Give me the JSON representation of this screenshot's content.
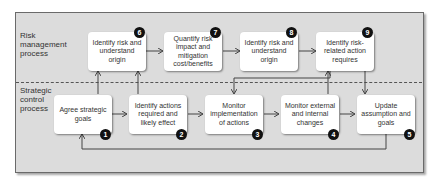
{
  "lanes": {
    "risk": "Risk management process",
    "strategic": "Strategic control process"
  },
  "boxes": [
    {
      "id": 1,
      "label": "Agree strategic goals",
      "lane": "strategic"
    },
    {
      "id": 2,
      "label": "Identify actions required and likely effect",
      "lane": "strategic"
    },
    {
      "id": 3,
      "label": "Monitor implementation of actions",
      "lane": "strategic"
    },
    {
      "id": 4,
      "label": "Monitor external and internal changes",
      "lane": "strategic"
    },
    {
      "id": 5,
      "label": "Update assumption and goals",
      "lane": "strategic"
    },
    {
      "id": 6,
      "label": "Identify risk and understand origin",
      "lane": "risk"
    },
    {
      "id": 7,
      "label": "Quantify risk impact and mitigation cost/benefits",
      "lane": "risk"
    },
    {
      "id": 8,
      "label": "Identify risk and understand origin",
      "lane": "risk"
    },
    {
      "id": 9,
      "label": "Identify risk-related action requires",
      "lane": "risk"
    }
  ],
  "badges": {
    "b1": "1",
    "b2": "2",
    "b3": "3",
    "b4": "4",
    "b5": "5",
    "b6": "6",
    "b7": "7",
    "b8": "8",
    "b9": "9"
  },
  "connections": [
    {
      "from": 1,
      "to": 2
    },
    {
      "from": 2,
      "to": 3
    },
    {
      "from": 3,
      "to": 4
    },
    {
      "from": 4,
      "to": 5
    },
    {
      "from": 5,
      "to": 1
    },
    {
      "from": 1,
      "to": 6
    },
    {
      "from": 2,
      "to": 6
    },
    {
      "from": 6,
      "to": 7
    },
    {
      "from": 7,
      "to": 8
    },
    {
      "from": 8,
      "to": 9
    },
    {
      "from": 4,
      "to": 9
    },
    {
      "from": 9,
      "to": 3
    },
    {
      "from": 9,
      "to": 5
    }
  ],
  "colors": {
    "frame": "#dcdcdc",
    "box": "#ffffff",
    "badge": "#111111",
    "line": "#444444"
  }
}
